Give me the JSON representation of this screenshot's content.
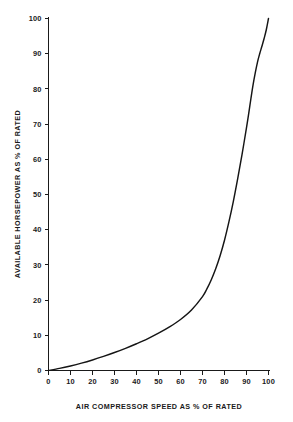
{
  "chart_data": {
    "type": "line",
    "title": "",
    "xlabel": "AIR COMPRESSOR SPEED AS % OF RATED",
    "ylabel": "AVAILABLE HORSEPOWER AS % OF RATED",
    "xlim": [
      0,
      100
    ],
    "ylim": [
      0,
      100
    ],
    "grid": false,
    "legend": null,
    "xticks": [
      0,
      10,
      20,
      30,
      40,
      50,
      60,
      70,
      80,
      90,
      100
    ],
    "xtick_labels": [
      "0",
      "10",
      "20",
      "30",
      "40",
      "50",
      "60",
      "70",
      "80",
      "90",
      "100"
    ],
    "yticks": [
      0,
      10,
      20,
      30,
      40,
      50,
      60,
      70,
      80,
      90,
      100
    ],
    "ytick_labels": [
      "0",
      "10",
      "20",
      "30",
      "40",
      "50",
      "60",
      "70",
      "80",
      "90",
      "100"
    ],
    "series": [
      {
        "name": "available horsepower",
        "x": [
          0,
          5,
          10,
          15,
          20,
          25,
          30,
          35,
          40,
          45,
          50,
          55,
          60,
          65,
          70,
          72,
          74,
          76,
          78,
          80,
          82,
          84,
          86,
          88,
          90,
          91,
          92,
          93,
          94,
          95,
          96,
          97,
          98,
          99,
          100
        ],
        "y": [
          0.0,
          0.6,
          1.3,
          2.1,
          3.0,
          4.0,
          5.1,
          6.3,
          7.6,
          9.0,
          10.6,
          12.4,
          14.5,
          17.2,
          21.0,
          23.2,
          25.8,
          28.9,
          32.6,
          37.0,
          42.2,
          48.0,
          54.5,
          61.5,
          69.0,
          73.0,
          77.2,
          81.2,
          84.6,
          87.6,
          90.0,
          92.1,
          94.3,
          96.8,
          100.0
        ]
      }
    ]
  },
  "axes": {
    "x_title": "AIR COMPRESSOR SPEED AS % OF RATED",
    "y_title": "AVAILABLE HORSEPOWER AS % OF RATED"
  },
  "ticks": {
    "x": [
      "0",
      "10",
      "20",
      "30",
      "40",
      "50",
      "60",
      "70",
      "80",
      "90",
      "100"
    ],
    "y": [
      "0",
      "10",
      "20",
      "30",
      "40",
      "50",
      "60",
      "70",
      "80",
      "90",
      "100"
    ]
  },
  "colors": {
    "curve": "#151515",
    "axis": "#1a1a1a",
    "background": "#ffffff"
  }
}
